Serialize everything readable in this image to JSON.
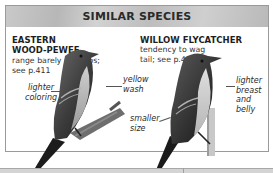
{
  "panel": {
    "title": "SIMILAR SPECIES"
  },
  "species": [
    {
      "name_line1": "EASTERN",
      "name_line2": "WOOD-PEWEE",
      "desc_line1": "range barely overlaps;",
      "desc_line2": "see p.411",
      "callouts": [
        {
          "line1": "lighter",
          "line2": "coloring"
        },
        {
          "line1": "yellow",
          "line2": "wash"
        }
      ]
    },
    {
      "name_line1": "WILLOW FLYCATCHER",
      "desc_line1": "tendency to wag",
      "desc_line2": "tail; see p.414",
      "callouts": [
        {
          "line1": "smaller",
          "line2": "size"
        },
        {
          "line1": "lighter",
          "line2": "breast",
          "line3": "and",
          "line4": "belly"
        }
      ]
    }
  ],
  "colors": {
    "header_band": "#c4c4c4",
    "border": "#9a9a9a",
    "text": "#1e1e1e"
  }
}
